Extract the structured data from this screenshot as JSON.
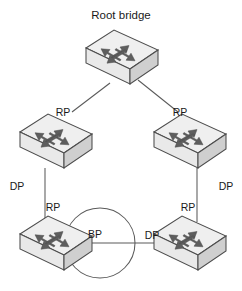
{
  "diagram": {
    "title": "Root bridge",
    "type": "spanning-tree-topology",
    "background_color": "#ffffff",
    "line_color": "#5a5a5a",
    "label_color": "#1a1a1a",
    "switch_colors": {
      "top_face": "#efefef",
      "front_face": "#e9e9e9",
      "side_face": "#cfcfcf",
      "outline": "#4d4d4d",
      "arrow": "#5e5e5e"
    },
    "nodes": [
      {
        "id": "root",
        "name": "root-bridge-switch",
        "icon": "network-switch-icon",
        "title": "Root bridge"
      },
      {
        "id": "left-upper",
        "name": "upper-left-switch",
        "icon": "network-switch-icon",
        "title": ""
      },
      {
        "id": "right-upper",
        "name": "upper-right-switch",
        "icon": "network-switch-icon",
        "title": ""
      },
      {
        "id": "left-lower",
        "name": "lower-left-switch",
        "icon": "network-switch-icon",
        "title": ""
      },
      {
        "id": "right-lower",
        "name": "lower-right-switch",
        "icon": "network-switch-icon",
        "title": ""
      }
    ],
    "port_labels": [
      {
        "id": "rp-left-upper",
        "text": "RP",
        "role": "root-port",
        "attached_to": "left-upper"
      },
      {
        "id": "rp-right-upper",
        "text": "RP",
        "role": "root-port",
        "attached_to": "right-upper"
      },
      {
        "id": "dp-left",
        "text": "DP",
        "role": "designated-port",
        "attached_to": "left-upper"
      },
      {
        "id": "dp-right",
        "text": "DP",
        "role": "designated-port",
        "attached_to": "right-upper"
      },
      {
        "id": "rp-left-lower",
        "text": "RP",
        "role": "root-port",
        "attached_to": "left-lower"
      },
      {
        "id": "rp-right-lower",
        "text": "RP",
        "role": "root-port",
        "attached_to": "right-lower"
      },
      {
        "id": "bp-left-lower",
        "text": "BP",
        "role": "blocked-port",
        "attached_to": "left-lower"
      },
      {
        "id": "dp-bottom",
        "text": "DP",
        "role": "designated-port",
        "attached_to": "right-lower"
      }
    ],
    "links": [
      {
        "id": "root-to-left",
        "from": "root",
        "to": "left-upper",
        "style": "diagonal"
      },
      {
        "id": "root-to-right",
        "from": "root",
        "to": "right-upper",
        "style": "diagonal"
      },
      {
        "id": "left-upper-to-lower",
        "from": "left-upper",
        "to": "left-lower",
        "style": "vertical"
      },
      {
        "id": "right-upper-to-lower",
        "from": "right-upper",
        "to": "right-lower",
        "style": "vertical"
      },
      {
        "id": "bottom-link",
        "from": "left-lower",
        "to": "right-lower",
        "style": "horizontal"
      }
    ],
    "blocked_loop": {
      "name": "blocked-port-loop-indicator",
      "shape": "circle",
      "label": "BP"
    }
  }
}
